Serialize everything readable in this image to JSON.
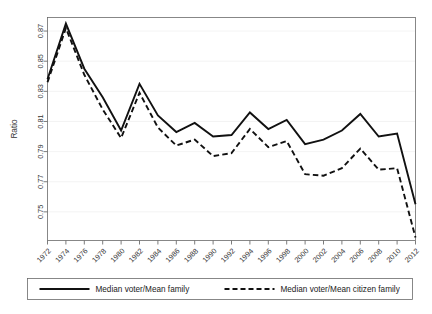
{
  "chart_data": {
    "type": "line",
    "title": "",
    "xlabel": "",
    "ylabel": "Ratio",
    "xlim": [
      1972,
      2012
    ],
    "ylim": [
      0.731,
      0.879
    ],
    "grid": true,
    "legend_position": "bottom",
    "x": [
      1972,
      1974,
      1976,
      1978,
      1980,
      1982,
      1984,
      1986,
      1988,
      1990,
      1992,
      1994,
      1996,
      1998,
      2000,
      2002,
      2004,
      2006,
      2008,
      2010,
      2012
    ],
    "xticklabels": [
      "1972",
      "1974",
      "1976",
      "1978",
      "1980",
      "1982",
      "1984",
      "1986",
      "1988",
      "1990",
      "1992",
      "1994",
      "1996",
      "1998",
      "2000",
      "2002",
      "2004",
      "2006",
      "2008",
      "2010",
      "2012"
    ],
    "yticks": [
      0.75,
      0.77,
      0.79,
      0.81,
      0.83,
      0.85,
      0.87
    ],
    "yticklabels": [
      "0.75",
      "0.77",
      "0.79",
      "0.81",
      "0.83",
      "0.85",
      "0.87"
    ],
    "series": [
      {
        "name": "Median voter/Mean family",
        "style": "solid",
        "color": "#111111",
        "values": [
          0.838,
          0.875,
          0.845,
          0.826,
          0.804,
          0.835,
          0.814,
          0.803,
          0.809,
          0.8,
          0.801,
          0.816,
          0.805,
          0.811,
          0.795,
          0.798,
          0.804,
          0.815,
          0.8,
          0.802,
          0.755
        ]
      },
      {
        "name": "Median voter/Mean citizen family",
        "style": "dashed",
        "color": "#111111",
        "values": [
          0.836,
          0.872,
          0.841,
          0.818,
          0.799,
          0.829,
          0.806,
          0.794,
          0.798,
          0.787,
          0.789,
          0.805,
          0.793,
          0.797,
          0.775,
          0.774,
          0.779,
          0.792,
          0.778,
          0.779,
          0.733
        ]
      }
    ]
  },
  "legend": {
    "items": [
      {
        "label": "Median voter/Mean family",
        "style": "solid"
      },
      {
        "label": "Median voter/Mean citizen family",
        "style": "dashed"
      }
    ]
  }
}
